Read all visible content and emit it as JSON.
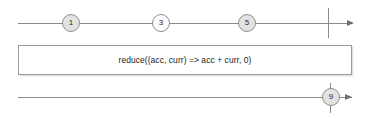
{
  "diagram": {
    "type": "rxjs-marble-diagram",
    "source_stream": {
      "name": "source-timeline",
      "marbles": [
        {
          "label": "1",
          "x": 71,
          "fill": "shaded"
        },
        {
          "label": "3",
          "x": 161,
          "fill": "plain"
        },
        {
          "label": "5",
          "x": 247,
          "fill": "shaded"
        }
      ],
      "completion": {
        "x": 328
      },
      "line": {
        "start_x": 18,
        "end_x": 347,
        "y": 23
      },
      "arrow": {
        "x": 347,
        "y": 23
      }
    },
    "operator": {
      "name": "reduce-operator",
      "label": "reduce((acc, curr) => acc + curr, 0)",
      "box": {
        "x": 18,
        "y": 45,
        "width": 334,
        "height": 30
      }
    },
    "result_stream": {
      "name": "result-timeline",
      "marbles": [
        {
          "label": "9",
          "x": 330,
          "fill": "shaded"
        }
      ],
      "completion": {
        "x": 330
      },
      "line": {
        "start_x": 18,
        "end_x": 352,
        "y": 97
      },
      "arrow": {
        "x": 345,
        "y": 97
      }
    },
    "colors": {
      "line": "#8a8a8a",
      "marble_border": "#8f8f8f",
      "marble_shaded_fill": "#e2e2e2",
      "marble_plain_fill": "#fdfdfd",
      "box_border": "#9a9a9a",
      "box_shadow": "#e4e4e4",
      "text": "#1d1d1d",
      "background": "#ffffff"
    }
  }
}
